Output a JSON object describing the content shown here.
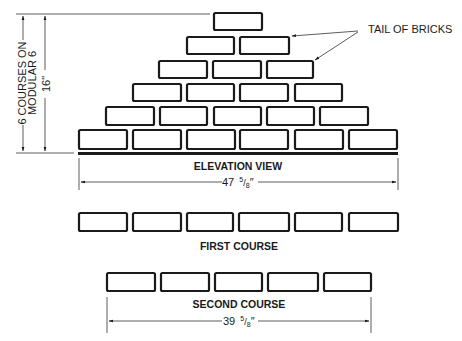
{
  "diagram": {
    "labels": {
      "tail_of_bricks": "TAIL OF BRICKS",
      "courses_line1": "6 COURSES ON",
      "courses_line2": "MODULAR 6",
      "height_dim": "16\"",
      "elevation_view": "ELEVATION VIEW",
      "elevation_width_whole": "47",
      "elevation_width_frac_num": "5",
      "elevation_width_frac_den": "8",
      "first_course": "FIRST COURSE",
      "second_course": "SECOND COURSE",
      "second_width_whole": "39",
      "second_width_frac_num": "5",
      "second_width_frac_den": "8"
    },
    "elevation_rows": [
      {
        "course": 6,
        "bricks": 1
      },
      {
        "course": 5,
        "bricks": 2
      },
      {
        "course": 4,
        "bricks": 3
      },
      {
        "course": 3,
        "bricks": 4
      },
      {
        "course": 2,
        "bricks": 5
      },
      {
        "course": 1,
        "bricks": 6
      }
    ],
    "first_course_bricks": 6,
    "second_course_bricks": 5,
    "colors": {
      "ink": "#1a1a1a",
      "background": "#ffffff"
    }
  }
}
